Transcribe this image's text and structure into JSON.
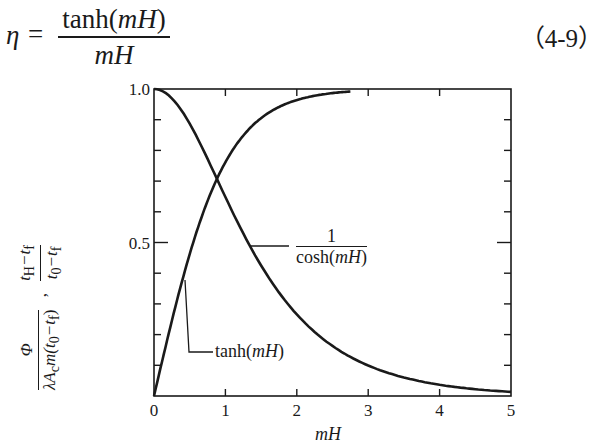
{
  "equation": {
    "lhs": "η",
    "equals": "=",
    "numerator_func": "tanh(",
    "numerator_arg": "mH",
    "numerator_close": ")",
    "denominator": "mH",
    "number": "（4-9）"
  },
  "chart_data": {
    "type": "line",
    "title": "",
    "xlabel": "mH",
    "ylabel": "Φ / (λA_c m(t_0 − t_f)) , (t_H − t_f)/(t_0 − t_f)",
    "xlim": [
      0,
      5
    ],
    "ylim": [
      0,
      1.0
    ],
    "x_ticks": [
      "0",
      "1",
      "2",
      "3",
      "4",
      "5"
    ],
    "y_tick_labels": [
      "0.5",
      "1.0"
    ],
    "y_minor_step": 0.1,
    "grid": false,
    "legend": "inline annotations",
    "series": [
      {
        "name": "tanh(mH)",
        "function": "tanh",
        "x": [
          0,
          0.25,
          0.5,
          0.75,
          1.0,
          1.5,
          2.0,
          2.5,
          2.75
        ],
        "values": [
          0.0,
          0.245,
          0.462,
          0.635,
          0.762,
          0.905,
          0.964,
          0.987,
          0.992
        ]
      },
      {
        "name": "1/cosh(mH)",
        "function": "sech",
        "x": [
          0,
          0.5,
          1.0,
          1.5,
          2.0,
          2.5,
          3.0,
          3.5,
          4.0,
          4.5,
          5.0
        ],
        "values": [
          1.0,
          0.887,
          0.648,
          0.425,
          0.266,
          0.163,
          0.099,
          0.06,
          0.037,
          0.022,
          0.013
        ]
      }
    ],
    "annotations": [
      {
        "text": "tanh(mH)",
        "at_x": 0.4
      },
      {
        "text": "1/cosh(mH)",
        "at_x": 1.35
      }
    ]
  },
  "labels": {
    "y_num_top": "t",
    "y_num_top_sub1": "H",
    "y_num_mid": "−t",
    "y_num_mid_sub": "f",
    "y_den2": "t",
    "y_den2_sub1": "0",
    "y_den2_mid": "−t",
    "y_den2_sub2": "f",
    "phi": "Φ",
    "y_den1": "λA",
    "y_den1_sub": "c",
    "y_den1_rest": "m(t",
    "y_den1_sub2": "0",
    "y_den1_rest2": "−t",
    "y_den1_sub3": "f",
    "y_den1_close": ")",
    "comma": ",",
    "sech_num": "1",
    "sech_den_func": "cosh(",
    "sech_den_arg": "mH",
    "sech_den_close": ")",
    "tanh_func": "tanh(",
    "tanh_arg": "mH",
    "tanh_close": ")",
    "x_axis": "mH"
  }
}
